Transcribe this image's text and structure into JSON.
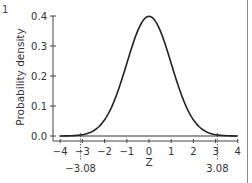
{
  "panel_label": "1",
  "chart_data": {
    "type": "line",
    "title": "",
    "xlabel": "Z",
    "ylabel": "Probability density",
    "xlim": [
      -4,
      4
    ],
    "ylim": [
      0.0,
      0.4
    ],
    "x_ticks": [
      "-4",
      "-3",
      "-2",
      "-1",
      "0",
      "1",
      "2",
      "3",
      "4"
    ],
    "y_ticks": [
      "0.0",
      "0.1",
      "0.2",
      "0.3",
      "0.4"
    ],
    "grid": false,
    "legend": null,
    "series": [
      {
        "name": "Standard normal density",
        "x": [
          -4,
          -3.5,
          -3,
          -2.5,
          -2,
          -1.5,
          -1,
          -0.5,
          0,
          0.5,
          1,
          1.5,
          2,
          2.5,
          3,
          3.5,
          4
        ],
        "y": [
          0.0001,
          0.0009,
          0.0044,
          0.0175,
          0.054,
          0.1295,
          0.242,
          0.3521,
          0.3989,
          0.3521,
          0.242,
          0.1295,
          0.054,
          0.0175,
          0.0044,
          0.0009,
          0.0001
        ]
      }
    ],
    "annotations": [
      {
        "type": "dotted-vline",
        "x": -3.08,
        "label": "−3.08"
      },
      {
        "type": "dotted-vline",
        "x": 3.08,
        "label": "3.08"
      }
    ],
    "line_color": "#222222"
  }
}
